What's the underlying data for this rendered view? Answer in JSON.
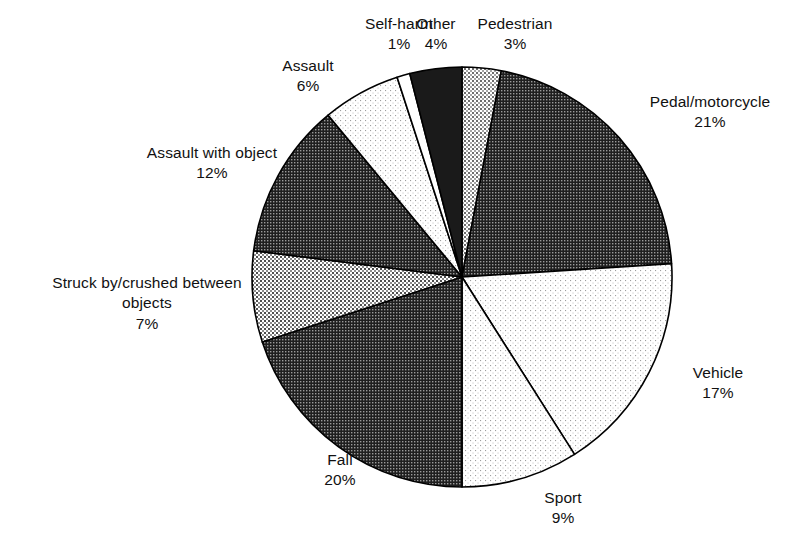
{
  "chart_data": {
    "type": "pie",
    "title": "",
    "subtitle": "",
    "xlabel": "",
    "ylabel": "",
    "legend_position": "labels-outside",
    "grid": false,
    "start_angle_deg": 0,
    "direction": "clockwise",
    "total_pct": 100,
    "categories": [
      "Pedestrian",
      "Pedal/motorcycle",
      "Vehicle",
      "Sport",
      "Fall",
      "Struck by/crushed between objects",
      "Assault with object",
      "Assault",
      "Self-harm",
      "Other"
    ],
    "values": [
      3,
      21,
      17,
      9,
      20,
      7,
      12,
      6,
      1,
      4
    ],
    "slices": [
      {
        "label": "Pedestrian",
        "value": 3,
        "pct_text": "3%",
        "fill": "#b8b8b8",
        "pattern": "dots-light",
        "label_x": 455,
        "label_y": 14,
        "label_width": 120,
        "wrap": false
      },
      {
        "label": "Pedal/motorcycle",
        "value": 21,
        "pct_text": "21%",
        "fill": "#4a4a4a",
        "pattern": "dots-dark",
        "label_x": 625,
        "label_y": 92,
        "label_width": 170,
        "wrap": false
      },
      {
        "label": "Vehicle",
        "value": 17,
        "pct_text": "17%",
        "fill": "#f2f2f2",
        "pattern": "dots-verylight",
        "label_x": 663,
        "label_y": 363,
        "label_width": 110,
        "wrap": false
      },
      {
        "label": "Sport",
        "value": 9,
        "pct_text": "9%",
        "fill": "#ededed",
        "pattern": "dots-verylight",
        "label_x": 513,
        "label_y": 488,
        "label_width": 100,
        "wrap": false
      },
      {
        "label": "Fall",
        "value": 20,
        "pct_text": "20%",
        "fill": "#3a3a3a",
        "pattern": "dots-dark",
        "label_x": 290,
        "label_y": 450,
        "label_width": 100,
        "wrap": false
      },
      {
        "label": "Struck by/crushed between objects",
        "value": 7,
        "pct_text": "7%",
        "fill": "#a0a0a0",
        "pattern": "dots-medium",
        "label_x": 38,
        "label_y": 273,
        "label_width": 218,
        "wrap": true
      },
      {
        "label": "Assault with object",
        "value": 12,
        "pct_text": "12%",
        "fill": "#3f3f3f",
        "pattern": "dots-dark",
        "label_x": 122,
        "label_y": 143,
        "label_width": 180,
        "wrap": false
      },
      {
        "label": "Assault",
        "value": 6,
        "pct_text": "6%",
        "fill": "#efefef",
        "pattern": "dots-verylight",
        "label_x": 253,
        "label_y": 56,
        "label_width": 110,
        "wrap": false
      },
      {
        "label": "Self-harm",
        "value": 1,
        "pct_text": "1%",
        "fill": "#ffffff",
        "pattern": "solid-white",
        "label_x": 344,
        "label_y": 14,
        "label_width": 110,
        "wrap": false
      },
      {
        "label": "Other",
        "value": 4,
        "pct_text": "4%",
        "fill": "#1c1c1c",
        "pattern": "solid-dark",
        "label_x": 401,
        "label_y": 14,
        "label_width": 70,
        "wrap": false
      }
    ],
    "geometry": {
      "center_x": 462,
      "center_y": 277,
      "radius": 210
    },
    "stroke_color": "#000000"
  }
}
